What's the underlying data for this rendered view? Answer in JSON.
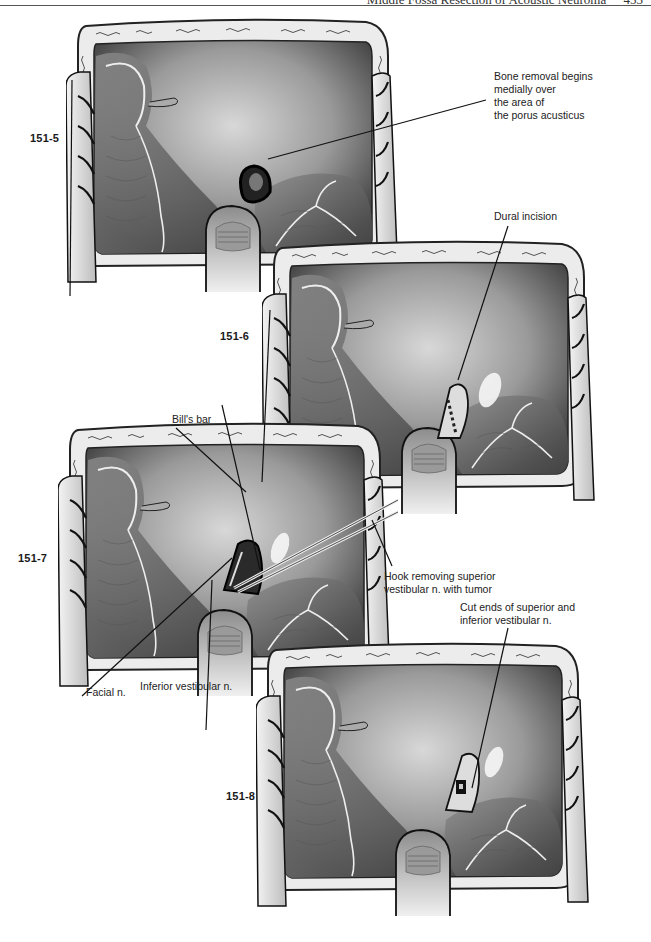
{
  "page": {
    "running_head": "Middle Fossa Resection of Acoustic Neuroma",
    "page_number": "455"
  },
  "figures": [
    {
      "number": "151-5",
      "labels": [
        {
          "lines": [
            "Bone removal begins",
            "medially over",
            "the area of",
            "the porus acusticus"
          ]
        }
      ]
    },
    {
      "number": "151-6",
      "labels": [
        {
          "lines": [
            "Dural incision"
          ]
        }
      ]
    },
    {
      "number": "151-7",
      "labels": [
        {
          "lines": [
            "Bill's bar"
          ]
        },
        {
          "lines": [
            "Hook removing superior",
            "vestibular n. with tumor"
          ]
        },
        {
          "lines": [
            "Facial n."
          ]
        },
        {
          "lines": [
            "Inferior vestibular n."
          ]
        }
      ]
    },
    {
      "number": "151-8",
      "labels": [
        {
          "lines": [
            "Cut ends of superior and",
            "inferior vestibular n."
          ]
        }
      ]
    }
  ],
  "colors": {
    "ink": "#1a1a1a",
    "tissue_dark": "#3a3a3a",
    "tissue_mid": "#7a7a7a",
    "tissue_light": "#c8c8c8",
    "bone_rim": "#e8e8e8"
  }
}
